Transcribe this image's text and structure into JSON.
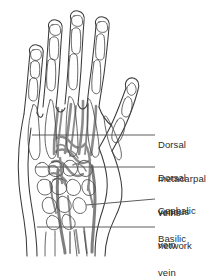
{
  "figure": {
    "colors": {
      "background": "#ffffff",
      "outline": "#3a3a3a",
      "bone_outline": "#4a4a4a",
      "vein": "#8c8c8c",
      "vein_dark": "#6f6f6f",
      "leader_line": "#545454",
      "text": "#2b2b2b"
    }
  },
  "labels": [
    {
      "id": "dorsal-metacarpal-veins",
      "lines": [
        "Dorsal",
        "metacarpal",
        "veins"
      ],
      "text_x": 158,
      "text_y": 122,
      "leader": {
        "x1": 32,
        "y1": 135,
        "x2": 155,
        "y2": 135,
        "dash": "—"
      }
    },
    {
      "id": "dorsal-venous-network",
      "lines": [
        "Dorsal",
        "venous",
        "network"
      ],
      "text_x": 158,
      "text_y": 155,
      "leader": {
        "x1": 35,
        "y1": 167,
        "x2": 155,
        "y2": 167,
        "dash": "—"
      }
    },
    {
      "id": "cephalic-vein",
      "lines": [
        "Cephalic",
        "vein"
      ],
      "text_x": 158,
      "text_y": 188,
      "leader": {
        "x1": 86,
        "y1": 205,
        "x2": 155,
        "y2": 199,
        "dash": "—"
      }
    },
    {
      "id": "basilic-vein",
      "lines": [
        "Basilic",
        "vein"
      ],
      "text_x": 158,
      "text_y": 215,
      "leader": {
        "x1": 37,
        "y1": 227,
        "x2": 155,
        "y2": 227,
        "dash": "—"
      }
    }
  ],
  "anatomy": {
    "digits": [
      {
        "name": "thumb",
        "label": "thumb"
      },
      {
        "name": "index-finger",
        "label": "index finger"
      },
      {
        "name": "middle-finger",
        "label": "middle finger"
      },
      {
        "name": "ring-finger",
        "label": "ring finger"
      },
      {
        "name": "little-finger",
        "label": "little finger"
      }
    ],
    "structures": [
      "hand-outline",
      "phalanx-bones",
      "metacarpal-bones",
      "carpal-bones",
      "dorsal-metacarpal-veins",
      "dorsal-venous-network",
      "cephalic-vein",
      "basilic-vein"
    ]
  }
}
